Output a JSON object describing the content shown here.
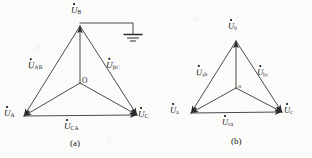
{
  "figure": {
    "type": "three-phase-voltage-phasor-diagrams",
    "panels": [
      {
        "id": "a",
        "caption": "(a)",
        "origin_label": "O",
        "has_ground_symbol": true,
        "ground_connected_to": "B",
        "vertex_labels": [
          {
            "key": "A",
            "symbol": "U",
            "subscript": "A",
            "position": "bottom-left"
          },
          {
            "key": "B",
            "symbol": "U",
            "subscript": "B",
            "position": "top"
          },
          {
            "key": "C",
            "symbol": "U",
            "subscript": "C",
            "position": "bottom-right"
          }
        ],
        "side_labels": [
          {
            "key": "AB",
            "symbol": "U",
            "subscript": "AB",
            "position": "left-side"
          },
          {
            "key": "BC",
            "symbol": "U",
            "subscript": "BC",
            "position": "right-side"
          },
          {
            "key": "CA",
            "symbol": "U",
            "subscript": "CA",
            "position": "bottom-side"
          }
        ]
      },
      {
        "id": "b",
        "caption": "(b)",
        "origin_label": "o",
        "has_ground_symbol": false,
        "ground_connected_to": "",
        "vertex_labels": [
          {
            "key": "a",
            "symbol": "U",
            "subscript": "a",
            "position": "bottom-left"
          },
          {
            "key": "b",
            "symbol": "U",
            "subscript": "b",
            "position": "top"
          },
          {
            "key": "c",
            "symbol": "U",
            "subscript": "c",
            "position": "bottom-right"
          }
        ],
        "side_labels": [
          {
            "key": "ab",
            "symbol": "U",
            "subscript": "ab",
            "position": "left-side"
          },
          {
            "key": "bc",
            "symbol": "U",
            "subscript": "bc",
            "position": "right-side"
          },
          {
            "key": "ca",
            "symbol": "U",
            "subscript": "ca",
            "position": "bottom-side"
          }
        ]
      }
    ],
    "style": {
      "line_color": "#2b2b2f",
      "background": "#fbfbfa",
      "text_color": "#17171a"
    }
  }
}
